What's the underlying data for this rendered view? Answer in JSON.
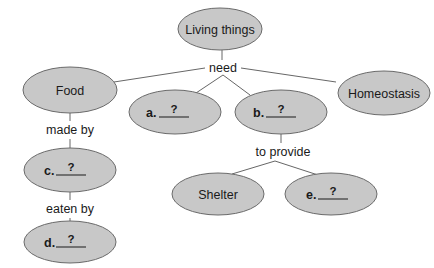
{
  "diagram": {
    "type": "concept-map",
    "colors": {
      "node_fill": "#c8c8c8",
      "node_stroke": "#6a6a6a",
      "line": "#555555",
      "text": "#1a1a1a"
    },
    "nodes": {
      "root": {
        "label": "Living things"
      },
      "food": {
        "label": "Food"
      },
      "a": {
        "letter": "a.",
        "blank": "?"
      },
      "b": {
        "letter": "b.",
        "blank": "?"
      },
      "homeostasis": {
        "label": "Homeostasis"
      },
      "c": {
        "letter": "c.",
        "blank": "?"
      },
      "d": {
        "letter": "d.",
        "blank": "?"
      },
      "shelter": {
        "label": "Shelter"
      },
      "e": {
        "letter": "e.",
        "blank": "?"
      }
    },
    "connectors": {
      "need": "need",
      "made_by": "made by",
      "eaten_by": "eaten by",
      "to_provide": "to provide"
    },
    "edges": [
      {
        "from": "Living things",
        "via": "need",
        "to": [
          "Food",
          "a.",
          "b.",
          "Homeostasis"
        ]
      },
      {
        "from": "Food",
        "via": "made by",
        "to": [
          "c."
        ]
      },
      {
        "from": "c.",
        "via": "eaten by",
        "to": [
          "d."
        ]
      },
      {
        "from": "b.",
        "via": "to provide",
        "to": [
          "Shelter",
          "e."
        ]
      }
    ]
  }
}
